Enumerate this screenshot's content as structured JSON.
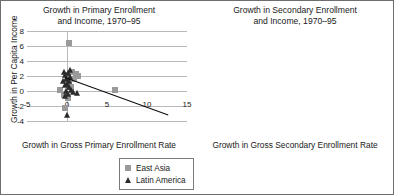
{
  "figure": {
    "border_color": "#6e6e6e",
    "background": "#ffffff"
  },
  "legend_labels": {
    "east_asia": "East Asia",
    "latin_america": "Latin America"
  },
  "colors": {
    "east_asia_marker": "#9a9a9a",
    "latin_america_marker": "#2b2b2b",
    "gridline": "#b9b9b9",
    "trendline": "#0d0d0d"
  },
  "chart_data": [
    {
      "id": "primary",
      "type": "scatter",
      "title": "Growth in Primary Enrollment\nand Income, 1970–95",
      "xlabel": "Growth in Gross Primary Enrollment Rate",
      "ylabel": "Growth in Per Capita Income",
      "xlim": [
        -5,
        15
      ],
      "ylim": [
        -4,
        8
      ],
      "xticks": [
        -5,
        0,
        5,
        10,
        15
      ],
      "yticks": [
        8,
        6,
        4,
        2,
        0,
        -2,
        -4
      ],
      "grid": true,
      "legend_position": "below-right",
      "series": [
        {
          "name": "East Asia",
          "marker": "square",
          "color": "#9a9a9a",
          "points": [
            [
              0.3,
              6.4
            ],
            [
              1.4,
              2.0
            ],
            [
              1.1,
              2.3
            ],
            [
              0.6,
              2.5
            ],
            [
              0.1,
              2.2
            ],
            [
              0.9,
              1.6
            ],
            [
              0.2,
              1.1
            ],
            [
              -0.9,
              0.1
            ],
            [
              -0.4,
              -0.5
            ],
            [
              0.1,
              -0.9
            ],
            [
              -0.2,
              -2.3
            ],
            [
              6.0,
              0.1
            ],
            [
              0.5,
              0.6
            ]
          ]
        },
        {
          "name": "Latin America",
          "marker": "triangle",
          "color": "#2b2b2b",
          "points": [
            [
              -0.4,
              2.5
            ],
            [
              -0.2,
              2.1
            ],
            [
              0.1,
              2.4
            ],
            [
              0.4,
              1.9
            ],
            [
              -0.1,
              1.6
            ],
            [
              0.3,
              1.3
            ],
            [
              0.0,
              1.0
            ],
            [
              -0.3,
              0.8
            ],
            [
              0.2,
              0.5
            ],
            [
              0.5,
              0.2
            ],
            [
              -0.1,
              0.0
            ],
            [
              0.8,
              -0.1
            ],
            [
              1.2,
              -0.2
            ],
            [
              0.1,
              -0.4
            ],
            [
              -0.2,
              -0.7
            ],
            [
              0.4,
              2.8
            ],
            [
              -0.5,
              1.4
            ],
            [
              0.0,
              -3.2
            ]
          ]
        }
      ],
      "trendline": {
        "x0": -0.3,
        "y0": 1.9,
        "x1": 12.6,
        "y1": -3.1
      }
    },
    {
      "id": "secondary",
      "type": "scatter",
      "title": "Growth in Secondary Enrollment\nand Income, 1970–95",
      "xlabel": "Growth in Gross Secondary Enrollment Rate",
      "ylabel": "Growth in Per Capita Income",
      "xlim": [
        -5,
        10
      ],
      "ylim": [
        -4,
        8
      ],
      "xticks": [
        -5,
        0,
        5,
        10
      ],
      "yticks": [
        8,
        6,
        4,
        2,
        0,
        -2,
        -4
      ],
      "grid": true,
      "legend_position": "below-right",
      "series": [
        {
          "name": "East Asia",
          "marker": "square",
          "color": "#9a9a9a",
          "points": [
            [
              2.2,
              6.2
            ],
            [
              5.7,
              6.3
            ],
            [
              -1.9,
              1.4
            ],
            [
              -0.6,
              -0.6
            ],
            [
              0.6,
              -0.9
            ],
            [
              1.1,
              -1.0
            ],
            [
              1.2,
              -0.3
            ],
            [
              1.8,
              1.7
            ],
            [
              3.3,
              2.3
            ],
            [
              4.0,
              2.6
            ],
            [
              3.9,
              1.5
            ],
            [
              2.6,
              -2.4
            ],
            [
              7.9,
              0.1
            ]
          ]
        },
        {
          "name": "Latin America",
          "marker": "triangle",
          "color": "#2b2b2b",
          "points": [
            [
              1.4,
              2.1
            ],
            [
              2.5,
              2.8
            ],
            [
              2.6,
              2.3
            ],
            [
              0.2,
              0.7
            ],
            [
              0.9,
              -1.2
            ],
            [
              1.6,
              0.4
            ],
            [
              1.8,
              0.0
            ],
            [
              2.0,
              0.5
            ],
            [
              2.2,
              -0.2
            ],
            [
              2.4,
              0.9
            ],
            [
              2.9,
              0.2
            ],
            [
              3.1,
              0.1
            ],
            [
              3.4,
              0.7
            ],
            [
              3.6,
              0.2
            ],
            [
              3.8,
              1.3
            ],
            [
              4.1,
              0.8
            ],
            [
              4.3,
              0.3
            ],
            [
              3.2,
              -3.1
            ],
            [
              1.3,
              -1.0
            ],
            [
              2.1,
              1.6
            ]
          ]
        }
      ],
      "trendline": {
        "x0": -2.1,
        "y0": 2.1,
        "x1": 8.6,
        "y1": 0.9
      }
    }
  ]
}
